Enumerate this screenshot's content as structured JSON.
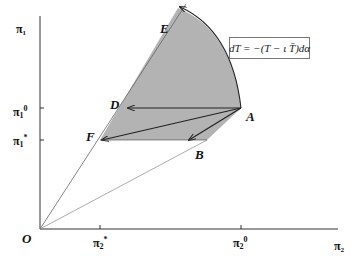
{
  "axes": {
    "y_label": "π₁",
    "x_label": "π₂",
    "origin_label": "O",
    "y_ticks": [
      {
        "base": "π",
        "sub": "1",
        "sup": "0"
      },
      {
        "base": "π",
        "sub": "1",
        "sup": "*"
      }
    ],
    "x_ticks": [
      {
        "base": "π",
        "sub": "2",
        "sup": "*"
      },
      {
        "base": "π",
        "sub": "2",
        "sup": "0"
      }
    ]
  },
  "points": {
    "A": "A",
    "B": "B",
    "D": "D",
    "E": "E",
    "F": "F"
  },
  "equation": "dT = −(T − ι T̄)dα",
  "colors": {
    "shaded_region": "#b3b3b3",
    "axis": "#333333",
    "ray": "#555555"
  }
}
